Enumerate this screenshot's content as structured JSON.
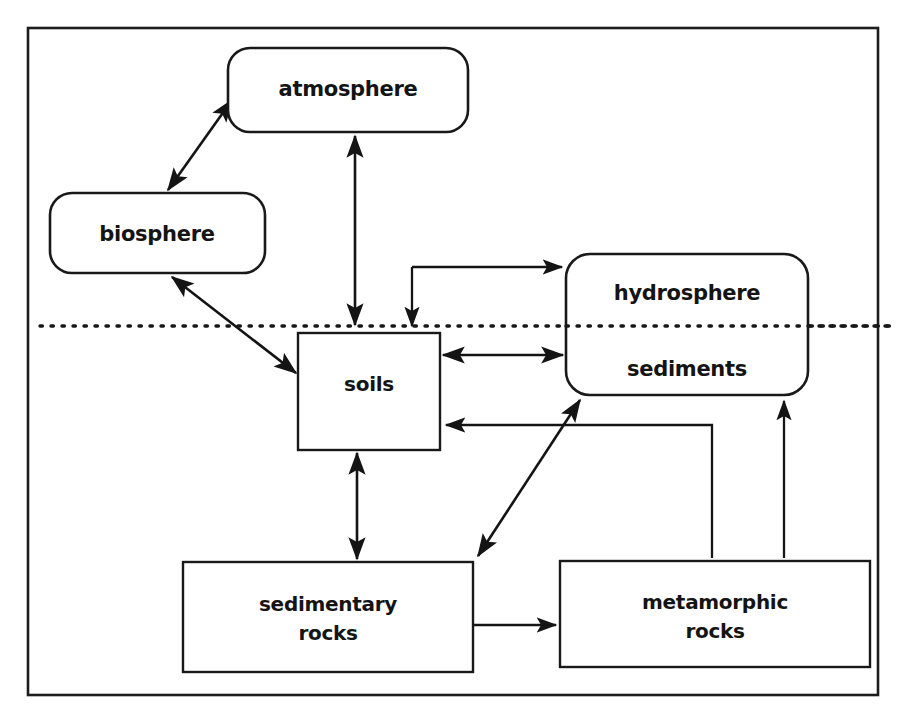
{
  "diagram": {
    "background_color": "#ffffff",
    "ink_color": "#141414",
    "frame": {
      "x": 28,
      "y": 28,
      "width": 850,
      "height": 667
    },
    "divider": {
      "name": "surface-interface-dotted-line",
      "y": 326,
      "x_start": 40,
      "x_end": 893,
      "style": "dotted"
    },
    "nodes": [
      {
        "id": "atmosphere",
        "label": "atmosphere",
        "shape": "rounded-rectangle",
        "x": 228,
        "y": 48,
        "width": 240,
        "height": 84,
        "radius": 22,
        "label_x": 348,
        "label_y": 89,
        "label_size": "lbl-22"
      },
      {
        "id": "biosphere",
        "label": "biosphere",
        "shape": "rounded-rectangle",
        "x": 50,
        "y": 193,
        "width": 215,
        "height": 80,
        "radius": 22,
        "label_x": 157,
        "label_y": 234,
        "label_size": "lbl-22"
      },
      {
        "id": "hydrosphere-sediments",
        "label": "hydrosphere",
        "label2": "sediments",
        "shape": "rounded-rectangle",
        "x": 566,
        "y": 254,
        "width": 242,
        "height": 141,
        "radius": 24,
        "label_x": 687,
        "label_y": 293,
        "label_size": "lbl-22",
        "label2_x": 687,
        "label2_y": 369
      },
      {
        "id": "soils",
        "label": "soils",
        "shape": "rectangle",
        "x": 298,
        "y": 333,
        "width": 142,
        "height": 117,
        "radius": 0,
        "label_x": 369,
        "label_y": 384,
        "label_size": "lbl-21"
      },
      {
        "id": "sedimentary-rocks",
        "label": "sedimentary",
        "label2": "rocks",
        "shape": "rectangle",
        "x": 183,
        "y": 562,
        "width": 290,
        "height": 110,
        "radius": 0,
        "label_x": 328,
        "label_y": 604,
        "label_size": "lbl-21",
        "label2_x": 328,
        "label2_y": 633
      },
      {
        "id": "metamorphic-rocks",
        "label": "metamorphic",
        "label2": "rocks",
        "shape": "rectangle",
        "x": 560,
        "y": 561,
        "width": 310,
        "height": 106,
        "radius": 0,
        "label_x": 715,
        "label_y": 602,
        "label_size": "lbl-21",
        "label2_x": 715,
        "label2_y": 631
      }
    ],
    "edges": [
      {
        "id": "biosphere-atmosphere",
        "from": "biosphere",
        "to": "atmosphere",
        "direction": "both",
        "path": "M 168 190 L 232 100"
      },
      {
        "id": "atmosphere-soils",
        "from": "atmosphere",
        "to": "soils",
        "direction": "both",
        "path": "M 355 325 L 355 136"
      },
      {
        "id": "biosphere-soils",
        "from": "biosphere",
        "to": "soils",
        "direction": "both",
        "path": "M 172 277 L 296 373"
      },
      {
        "id": "soils-hydrosphere",
        "from": "soils",
        "to": "hydrosphere-sediments",
        "direction": "both",
        "path": "M 443 355 L 563 355"
      },
      {
        "id": "atmosphere-hydrosphere-elbow",
        "from": "atmosphere-branch",
        "to": "hydrosphere-sediments",
        "direction": "both-ends",
        "path": "M 412 330 L 412 267 L 562 267"
      },
      {
        "id": "metamorphic-soils-return",
        "from": "metamorphic-rocks",
        "to": "soils",
        "direction": "single",
        "path": "M 712 558 L 712 425 L 444 425"
      },
      {
        "id": "metamorphic-sediments",
        "from": "metamorphic-rocks",
        "to": "hydrosphere-sediments",
        "direction": "single",
        "path": "M 784 558 L 784 400"
      },
      {
        "id": "sedimentary-sediments-diagonal",
        "from": "sedimentary-rocks",
        "to": "hydrosphere-sediments",
        "direction": "both",
        "path": "M 478 556 L 580 400"
      },
      {
        "id": "soils-sedimentary",
        "from": "soils",
        "to": "sedimentary-rocks",
        "direction": "both",
        "path": "M 357 453 L 357 559"
      },
      {
        "id": "sedimentary-metamorphic",
        "from": "sedimentary-rocks",
        "to": "metamorphic-rocks",
        "direction": "single",
        "path": "M 474 625 L 557 625"
      }
    ]
  }
}
